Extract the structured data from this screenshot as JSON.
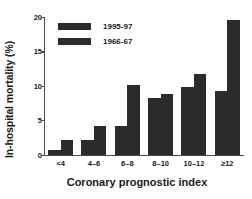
{
  "chart_data": {
    "type": "bar",
    "title": "",
    "xlabel": "Coronary prognostic index",
    "ylabel": "In-hospital mortality (%)",
    "categories": [
      "<4",
      "4–6",
      "6–8",
      "8–10",
      "10–12",
      "≥12"
    ],
    "series": [
      {
        "name": "1995-97",
        "values": [
          0.7,
          2.2,
          4.2,
          8.2,
          9.8,
          9.2
        ]
      },
      {
        "name": "1966-67",
        "values": [
          2.2,
          4.2,
          10.2,
          8.9,
          11.8,
          19.5
        ]
      }
    ],
    "ylim": [
      0,
      20
    ],
    "yticks": [
      0,
      5,
      10,
      15,
      20
    ],
    "ytick_labels": [
      "0",
      "5",
      "10",
      "15",
      "20"
    ],
    "grid": false,
    "legend_position": "upper left",
    "bar_color": "#2b2b2b",
    "axis_color": "#4a4a4a"
  },
  "legend": {
    "entries": [
      {
        "label": "1995-97"
      },
      {
        "label": "1966-67"
      }
    ]
  }
}
